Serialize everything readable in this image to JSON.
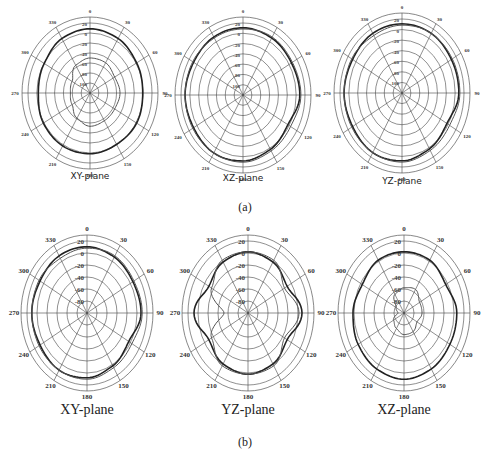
{
  "figure": {
    "row_a_label": "(a)",
    "row_b_label": "(b)"
  },
  "chart_data": [
    {
      "type": "polar",
      "panel": "a",
      "title": "XY-plane",
      "angle_ticks": [
        0,
        30,
        60,
        90,
        120,
        150,
        180,
        210,
        240,
        270,
        300,
        330
      ],
      "radial_ticks": [
        "20",
        "0",
        "-20",
        "-40",
        "-60",
        "-80",
        "-100"
      ],
      "series": [
        {
          "name": "co-pol",
          "description": "outer near-omni pattern with notches near 300 and 60 deg",
          "r_dB": [
            10,
            8,
            4,
            2,
            4,
            2,
            4,
            5,
            4,
            0,
            2,
            8
          ]
        },
        {
          "name": "cross-pol",
          "description": "small inner lobes, kidney-shaped",
          "r_dB": [
            -40,
            -40,
            -45,
            -42,
            -45,
            -45,
            -43,
            -50,
            -60,
            -62,
            -60,
            -45
          ]
        }
      ]
    },
    {
      "type": "polar",
      "panel": "a",
      "title": "XZ-plane",
      "angle_ticks": [
        0,
        30,
        60,
        90,
        120,
        150,
        180,
        210,
        240,
        270,
        300,
        330
      ],
      "radial_ticks": [
        "20",
        "0",
        "-20",
        "-40",
        "-60",
        "-80",
        "-100"
      ],
      "series": [
        {
          "name": "co-pol",
          "r_dB": [
            12,
            10,
            8,
            10,
            0,
            5,
            10,
            12,
            10,
            12,
            10,
            12
          ]
        },
        {
          "name": "cross-pol",
          "r_dB": [
            10,
            12,
            10,
            12,
            6,
            8,
            12,
            12,
            12,
            12,
            12,
            10
          ]
        }
      ]
    },
    {
      "type": "polar",
      "panel": "a",
      "title": "YZ-plane",
      "angle_ticks": [
        0,
        30,
        60,
        90,
        120,
        150,
        180,
        210,
        240,
        270,
        300,
        330
      ],
      "radial_ticks": [
        "20",
        "0",
        "-20",
        "-40",
        "-60",
        "-80",
        "-100"
      ],
      "series": [
        {
          "name": "co-pol",
          "r_dB": [
            12,
            12,
            10,
            10,
            0,
            5,
            10,
            12,
            10,
            12,
            10,
            12
          ]
        },
        {
          "name": "cross-pol",
          "r_dB": [
            10,
            12,
            12,
            12,
            6,
            8,
            12,
            12,
            12,
            12,
            12,
            8
          ]
        }
      ]
    },
    {
      "type": "polar",
      "panel": "b",
      "title": "XY-plane",
      "angle_ticks": [
        0,
        30,
        60,
        90,
        120,
        150,
        180,
        210,
        240,
        270,
        300,
        330
      ],
      "radial_ticks": [
        "20",
        "0",
        "-20",
        "-40",
        "-60",
        "-80"
      ],
      "series": [
        {
          "name": "co-pol",
          "r_dB": [
            12,
            10,
            8,
            10,
            0,
            5,
            10,
            12,
            10,
            12,
            10,
            12
          ]
        },
        {
          "name": "cross-pol",
          "r_dB": [
            10,
            12,
            10,
            12,
            6,
            8,
            12,
            12,
            12,
            12,
            12,
            8
          ]
        }
      ]
    },
    {
      "type": "polar",
      "panel": "b",
      "title": "YZ-plane",
      "angle_ticks": [
        0,
        30,
        60,
        90,
        120,
        150,
        180,
        210,
        240,
        270,
        300,
        330
      ],
      "radial_ticks": [
        "20",
        "0",
        "-20",
        "-40",
        "-60",
        "-80"
      ],
      "series": [
        {
          "name": "co-pol",
          "description": "four-lobe shape with deep null near 270",
          "r_dB": [
            5,
            2,
            -5,
            10,
            -5,
            2,
            5,
            2,
            -5,
            10,
            -5,
            2
          ]
        },
        {
          "name": "cross-pol",
          "r_dB": [
            5,
            5,
            -10,
            5,
            -10,
            5,
            5,
            5,
            -10,
            -40,
            -10,
            5
          ]
        }
      ]
    },
    {
      "type": "polar",
      "panel": "b",
      "title": "XZ-plane",
      "angle_ticks": [
        0,
        30,
        60,
        90,
        120,
        150,
        180,
        210,
        240,
        270,
        300,
        330
      ],
      "radial_ticks": [
        "20",
        "0",
        "-20",
        "-40",
        "-60",
        "-80"
      ],
      "series": [
        {
          "name": "co-pol",
          "r_dB": [
            5,
            5,
            0,
            8,
            8,
            10,
            12,
            10,
            8,
            5,
            0,
            5
          ]
        },
        {
          "name": "cross-pol",
          "r_dB": [
            -45,
            -42,
            -50,
            -50,
            -55,
            -50,
            -50,
            -55,
            -60,
            -70,
            -65,
            -50
          ]
        }
      ]
    }
  ]
}
